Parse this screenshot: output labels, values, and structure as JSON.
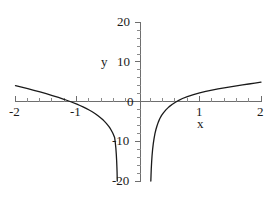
{
  "chart_data": {
    "type": "line",
    "title": "",
    "subtitle": "",
    "xlabel": "x",
    "ylabel": "y",
    "xlim": [
      -2,
      2
    ],
    "ylim": [
      -20,
      20
    ],
    "grid": false,
    "legend": null,
    "legend_position": "none",
    "x_ticks": [
      -2,
      -1,
      0,
      1,
      2
    ],
    "x_tick_labels": [
      "-2",
      "-1",
      "0",
      "1",
      "2"
    ],
    "y_ticks": [
      -20,
      -10,
      0,
      10,
      20
    ],
    "y_tick_labels": [
      "-20",
      "-10",
      "0",
      "10",
      "20"
    ],
    "x_minor_tick_step": 0.2,
    "y_minor_tick_step": 2,
    "annotations": [],
    "series": [
      {
        "name": "left-branch",
        "description": "Branch for x less than the vertical asymptote near x = 0.2; descends from about y = 4 at x = -2 down through zero near x = -1.3 and plunges to y = -20 near x = -0.35",
        "x": [
          -2.0,
          -1.9,
          -1.8,
          -1.7,
          -1.6,
          -1.5,
          -1.4,
          -1.3,
          -1.2,
          -1.1,
          -1.0,
          -0.95,
          -0.9,
          -0.85,
          -0.8,
          -0.75,
          -0.7,
          -0.65,
          -0.6,
          -0.58,
          -0.55,
          -0.52,
          -0.5,
          -0.48,
          -0.46,
          -0.44,
          -0.42,
          -0.41,
          -0.4,
          -0.39,
          -0.385
        ],
        "y": [
          4.0,
          3.62,
          3.22,
          2.82,
          2.4,
          1.96,
          1.5,
          1.02,
          0.5,
          -0.06,
          -0.67,
          -1.0,
          -1.35,
          -1.73,
          -2.14,
          -2.58,
          -3.08,
          -3.64,
          -4.27,
          -4.55,
          -5.0,
          -5.5,
          -5.87,
          -6.27,
          -6.72,
          -7.23,
          -7.8,
          -8.12,
          -8.47,
          -8.85,
          -9.05
        ]
      },
      {
        "name": "left-branch-tail",
        "description": "Steep descent of left branch toward the vertical asymptote, reaching the bottom of the frame at y = -20",
        "x": [
          -0.385,
          -0.375,
          -0.365,
          -0.358,
          -0.352,
          -0.348,
          -0.345,
          -0.343,
          -0.342
        ],
        "y": [
          -9.05,
          -10.2,
          -11.7,
          -13.2,
          -14.9,
          -16.4,
          -17.8,
          -19.1,
          -20.0
        ]
      },
      {
        "name": "right-branch",
        "description": "Branch for x greater than the vertical asymptote; rises steeply from y = -20 near x = 0.2, crosses zero near x = 0.66 and reaches about y = 5 at x = 2",
        "x": [
          0.205,
          0.208,
          0.212,
          0.218,
          0.225,
          0.235,
          0.245,
          0.258,
          0.272,
          0.288,
          0.305,
          0.325,
          0.35,
          0.38,
          0.41,
          0.45,
          0.5,
          0.55,
          0.6,
          0.66,
          0.72,
          0.8,
          0.9,
          1.0,
          1.1,
          1.2,
          1.3,
          1.4,
          1.5,
          1.6,
          1.7,
          1.8,
          1.9,
          2.0
        ],
        "y": [
          -20.0,
          -18.6,
          -17.0,
          -15.2,
          -13.6,
          -11.9,
          -10.6,
          -9.3,
          -8.1,
          -7.05,
          -6.15,
          -5.25,
          -4.35,
          -3.5,
          -2.85,
          -2.1,
          -1.35,
          -0.75,
          -0.25,
          0.3,
          0.75,
          1.25,
          1.75,
          2.18,
          2.55,
          2.88,
          3.17,
          3.44,
          3.7,
          3.94,
          4.17,
          4.4,
          4.62,
          4.85
        ]
      }
    ],
    "features": {
      "vertical_asymptote_left_limit_x": -0.34,
      "vertical_asymptote_right_limit_x": 0.2,
      "x_intercepts": [
        -1.09,
        0.66
      ],
      "curve_value_at_x_min": 4.0,
      "curve_value_at_x_max": 4.85
    }
  },
  "labels": {
    "y_axis_name": "y",
    "x_axis_name": "x",
    "y_20": "20",
    "y_10": "10",
    "y_0": "0",
    "y_neg10": "-10",
    "y_neg20": "-20",
    "x_neg2": "-2",
    "x_neg1": "-1",
    "x_1": "1",
    "x_2": "2"
  },
  "style": {
    "curve_color": "#1a1a1a",
    "axis_color": "#6e6e6e",
    "tick_color": "#8a8a8a",
    "background_color": "#ffffff",
    "text_color": "#1a1a1a"
  }
}
